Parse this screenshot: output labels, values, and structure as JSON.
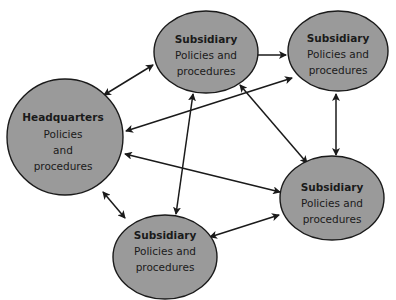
{
  "diagram": {
    "type": "network",
    "fill_color": "#9a9a9a",
    "stroke_color": "#1a1a1a",
    "nodes": [
      {
        "id": "hq",
        "title": "Headquarters",
        "lines": [
          "Policies",
          "and",
          "procedures"
        ],
        "shape": "circle",
        "cx": 65,
        "cy": 137,
        "rx": 58,
        "ry": 58
      },
      {
        "id": "sub_top_mid",
        "title": "Subsidiary",
        "lines": [
          "Policies and",
          "procedures"
        ],
        "shape": "ellipse",
        "cx": 206,
        "cy": 52,
        "rx": 52,
        "ry": 41
      },
      {
        "id": "sub_top_right",
        "title": "Subsidiary",
        "lines": [
          "Policies and",
          "procedures"
        ],
        "shape": "ellipse",
        "cx": 338,
        "cy": 51,
        "rx": 50,
        "ry": 40
      },
      {
        "id": "sub_right",
        "title": "Subsidiary",
        "lines": [
          "Policies and",
          "procedures"
        ],
        "shape": "ellipse",
        "cx": 332,
        "cy": 198,
        "rx": 52,
        "ry": 42
      },
      {
        "id": "sub_bottom",
        "title": "Subsidiary",
        "lines": [
          "Policies and",
          "procedures"
        ],
        "shape": "ellipse",
        "cx": 165,
        "cy": 257,
        "rx": 52,
        "ry": 42
      }
    ],
    "edges": [
      {
        "from": "hq",
        "to": "sub_top_mid",
        "bidirectional": true
      },
      {
        "from": "hq",
        "to": "sub_top_right",
        "bidirectional": true
      },
      {
        "from": "hq",
        "to": "sub_right",
        "bidirectional": true
      },
      {
        "from": "hq",
        "to": "sub_bottom",
        "bidirectional": true
      },
      {
        "from": "sub_top_mid",
        "to": "sub_top_right",
        "bidirectional": true
      },
      {
        "from": "sub_top_mid",
        "to": "sub_right",
        "bidirectional": true
      },
      {
        "from": "sub_top_mid",
        "to": "sub_bottom",
        "bidirectional": true
      },
      {
        "from": "sub_top_right",
        "to": "sub_right",
        "bidirectional": true
      },
      {
        "from": "sub_right",
        "to": "sub_bottom",
        "bidirectional": true
      }
    ]
  }
}
